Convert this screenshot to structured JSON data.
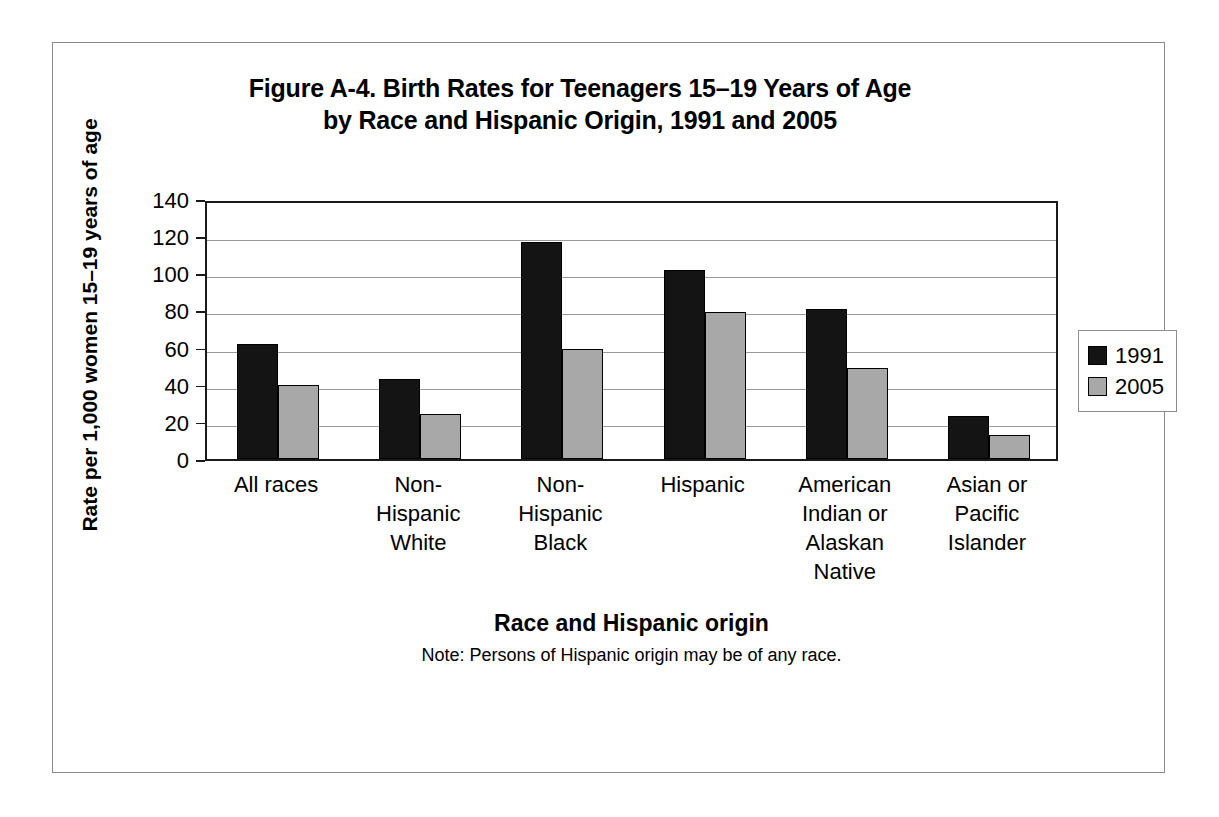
{
  "figure": {
    "title_line1": "Figure A-4. Birth Rates for Teenagers 15–19 Years of Age",
    "title_line2": "by Race and Hispanic Origin, 1991 and 2005",
    "note": "Note: Persons of Hispanic origin may be of any race."
  },
  "axes": {
    "y_title_line1": "Rate per 1,000 women",
    "y_title_line2": "15–19 years of age",
    "x_title": "Race and Hispanic origin"
  },
  "legend": {
    "position": "right",
    "items": [
      {
        "label": "1991",
        "color": "#141414"
      },
      {
        "label": "2005",
        "color": "#a8a8a8"
      }
    ]
  },
  "chart_data": {
    "type": "bar",
    "title": "Figure A-4. Birth Rates for Teenagers 15–19 Years of Age by Race and Hispanic Origin, 1991 and 2005",
    "xlabel": "Race and Hispanic origin",
    "ylabel": "Rate per 1,000 women 15–19 years of age",
    "ylim": [
      0,
      140
    ],
    "yticks": [
      0,
      20,
      40,
      60,
      80,
      100,
      120,
      140
    ],
    "ytick_labels": [
      "0",
      "20",
      "40",
      "60",
      "80",
      "100",
      "120",
      "140"
    ],
    "grid": true,
    "grid_axis": "y",
    "categories": [
      "All races",
      "Non-Hispanic White",
      "Non-Hispanic Black",
      "Hispanic",
      "American Indian or Alaskan Native",
      "Asian or Pacific Islander"
    ],
    "category_label_lines": [
      [
        "All races"
      ],
      [
        "Non-",
        "Hispanic",
        "White"
      ],
      [
        "Non-",
        "Hispanic",
        "Black"
      ],
      [
        "Hispanic"
      ],
      [
        "American",
        "Indian or",
        "Alaskan",
        "Native"
      ],
      [
        "Asian or",
        "Pacific",
        "Islander"
      ]
    ],
    "series": [
      {
        "name": "1991",
        "color": "#141414",
        "values": [
          62,
          43,
          117,
          102,
          81,
          23
        ]
      },
      {
        "name": "2005",
        "color": "#a8a8a8",
        "values": [
          40,
          24,
          59,
          79,
          49,
          13
        ]
      }
    ],
    "annotations": [
      "Note: Persons of Hispanic origin may be of any race."
    ]
  }
}
